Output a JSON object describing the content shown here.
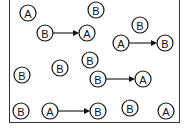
{
  "diagram": {
    "nodes": [
      {
        "id": "n1",
        "label": "A",
        "x": 28,
        "y": 13
      },
      {
        "id": "n2",
        "label": "B",
        "x": 96,
        "y": 10
      },
      {
        "id": "n3",
        "label": "B",
        "x": 45,
        "y": 33
      },
      {
        "id": "n4",
        "label": "A",
        "x": 87,
        "y": 33
      },
      {
        "id": "n5",
        "label": "B",
        "x": 140,
        "y": 25
      },
      {
        "id": "n6",
        "label": "A",
        "x": 121,
        "y": 43
      },
      {
        "id": "n7",
        "label": "B",
        "x": 165,
        "y": 43
      },
      {
        "id": "n8",
        "label": "B",
        "x": 22,
        "y": 75
      },
      {
        "id": "n9",
        "label": "B",
        "x": 60,
        "y": 68
      },
      {
        "id": "n10",
        "label": "B",
        "x": 90,
        "y": 60
      },
      {
        "id": "n11",
        "label": "B",
        "x": 98,
        "y": 79
      },
      {
        "id": "n12",
        "label": "A",
        "x": 143,
        "y": 79
      },
      {
        "id": "n13",
        "label": "B",
        "x": 21,
        "y": 111
      },
      {
        "id": "n14",
        "label": "A",
        "x": 50,
        "y": 111
      },
      {
        "id": "n15",
        "label": "B",
        "x": 98,
        "y": 111
      },
      {
        "id": "n16",
        "label": "B",
        "x": 130,
        "y": 108
      },
      {
        "id": "n17",
        "label": "A",
        "x": 166,
        "y": 111
      }
    ],
    "arrows": [
      {
        "from": "n3",
        "to": "n4",
        "label": "B to A"
      },
      {
        "from": "n6",
        "to": "n7",
        "label": "A to B"
      },
      {
        "from": "n11",
        "to": "n12",
        "label": "B to A"
      },
      {
        "from": "n14",
        "to": "n15",
        "label": "A to B"
      }
    ]
  }
}
